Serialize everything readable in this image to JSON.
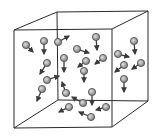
{
  "diagram": {
    "colors": {
      "edge": "#2a2a2a",
      "particle_fill": "#9a9a9a",
      "particle_center": "#d6d6d6",
      "particle_stroke": "#4a4a4a",
      "arrow": "#3a3a3a",
      "background": "#ffffff"
    },
    "cube": {
      "front": [
        [
          14,
          30
        ],
        [
          112,
          29
        ],
        [
          112,
          127
        ],
        [
          14,
          128
        ]
      ],
      "back": [
        [
          57,
          12
        ],
        [
          148,
          11
        ],
        [
          148,
          101
        ],
        [
          58,
          100
        ]
      ]
    },
    "particles": [
      {
        "x": 26,
        "y": 45,
        "dx": 33,
        "dy": 52
      },
      {
        "x": 44,
        "y": 41,
        "dx": 44,
        "dy": 54
      },
      {
        "x": 58,
        "y": 42,
        "dx": 69,
        "dy": 36
      },
      {
        "x": 96,
        "y": 37,
        "dx": 97,
        "dy": 50
      },
      {
        "x": 77,
        "y": 49,
        "dx": 89,
        "dy": 53
      },
      {
        "x": 64,
        "y": 58,
        "dx": 64,
        "dy": 72
      },
      {
        "x": 86,
        "y": 61,
        "dx": 78,
        "dy": 67
      },
      {
        "x": 103,
        "y": 58,
        "dx": 95,
        "dy": 64
      },
      {
        "x": 47,
        "y": 63,
        "dx": 40,
        "dy": 74
      },
      {
        "x": 118,
        "y": 54,
        "dx": 129,
        "dy": 57
      },
      {
        "x": 134,
        "y": 41,
        "dx": 135,
        "dy": 54
      },
      {
        "x": 124,
        "y": 65,
        "dx": 115,
        "dy": 72
      },
      {
        "x": 141,
        "y": 63,
        "dx": 132,
        "dy": 69
      },
      {
        "x": 84,
        "y": 71,
        "dx": 84,
        "dy": 82
      },
      {
        "x": 47,
        "y": 80,
        "dx": 59,
        "dy": 76
      },
      {
        "x": 42,
        "y": 89,
        "dx": 37,
        "dy": 101
      },
      {
        "x": 124,
        "y": 79,
        "dx": 124,
        "dy": 92
      },
      {
        "x": 66,
        "y": 93,
        "dx": 62,
        "dy": 82
      },
      {
        "x": 92,
        "y": 92,
        "dx": 92,
        "dy": 105
      },
      {
        "x": 83,
        "y": 103,
        "dx": 72,
        "dy": 97
      },
      {
        "x": 69,
        "y": 107,
        "dx": 59,
        "dy": 112
      },
      {
        "x": 106,
        "y": 107,
        "dx": 96,
        "dy": 110
      },
      {
        "x": 91,
        "y": 117,
        "dx": 79,
        "dy": 112
      }
    ]
  }
}
